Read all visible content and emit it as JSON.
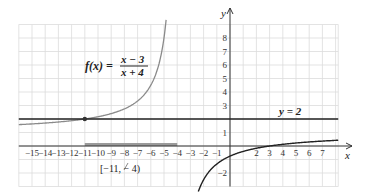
{
  "chart_data": {
    "type": "line",
    "title": "",
    "xlabel": "x",
    "ylabel": "y",
    "xlim": [
      -16,
      8
    ],
    "ylim": [
      -3,
      9
    ],
    "grid": true,
    "x_ticks": [
      -15,
      -14,
      -13,
      -12,
      -11,
      -10,
      -9,
      -8,
      -7,
      -6,
      -5,
      -4,
      -3,
      -2,
      -1,
      2,
      3,
      4,
      5,
      6,
      7
    ],
    "y_ticks": [
      8,
      7,
      6,
      5,
      4,
      3,
      1,
      -2
    ],
    "series": [
      {
        "name": "f(x) = (x - 3)/(x + 4)",
        "function": "(x-3)/(x+4)",
        "color": "#888888",
        "branch": "left",
        "domain": [
          -16,
          -4.9
        ]
      },
      {
        "name": "f(x) = (x - 3)/(x + 4)",
        "function": "(x-3)/(x+4)",
        "color": "#222222",
        "branch": "right",
        "domain": [
          -3.1,
          8.2
        ]
      },
      {
        "name": "y = 2",
        "function": "2",
        "color": "#222222",
        "domain": [
          -16,
          8.2
        ]
      }
    ],
    "annotations": [
      {
        "text": "f(x) = (x − 3)/(x + 4)",
        "position": "upper-left"
      },
      {
        "text": "y = 2",
        "position": "right, above line"
      },
      {
        "text": "[−11, −4)",
        "points_to": -8,
        "below_axis": true
      },
      {
        "point": [
          -11,
          2
        ],
        "marker": "dot"
      },
      {
        "interval_highlight": [
          -11,
          -4
        ],
        "on": "x-axis"
      }
    ]
  },
  "labels": {
    "func_lhs": "f(x) =",
    "func_num": "x − 3",
    "func_den": "x + 4",
    "asymptote": "y = 2",
    "interval": "[−11, − 4)",
    "x_axis": "x",
    "y_axis": "y"
  }
}
